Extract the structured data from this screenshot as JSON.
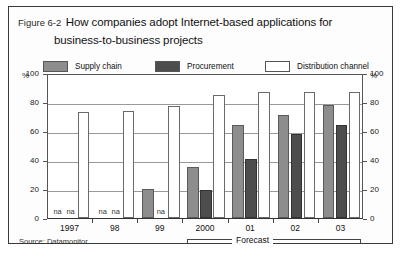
{
  "figure": {
    "label": "Figure 6-2",
    "title_line1": "How companies adopt Internet-based applications for",
    "title_line2": "business-to-business projects",
    "source": "Source: Datamonitor",
    "forecast_label": "Forecast",
    "na_text": "na",
    "percent_symbol": "%"
  },
  "legend": [
    {
      "name": "Supply chain",
      "color": "#8d8d8d"
    },
    {
      "name": "Procurement",
      "color": "#4d4d4d"
    },
    {
      "name": "Distribution channel",
      "color": "#ffffff"
    }
  ],
  "chart_data": {
    "type": "bar",
    "title": "How companies adopt Internet-based applications for business-to-business projects",
    "xlabel": "",
    "ylabel": "%",
    "ylim": [
      0,
      100
    ],
    "yticks": [
      0,
      20,
      40,
      60,
      80,
      100
    ],
    "grid": true,
    "legend_position": "top",
    "categories": [
      "1997",
      "98",
      "99",
      "2000",
      "01",
      "02",
      "03"
    ],
    "series": [
      {
        "name": "Supply chain",
        "color": "#8d8d8d",
        "values": [
          null,
          null,
          20,
          35,
          64,
          71,
          78
        ]
      },
      {
        "name": "Procurement",
        "color": "#4d4d4d",
        "values": [
          null,
          null,
          null,
          19,
          41,
          58,
          64
        ]
      },
      {
        "name": "Distribution channel",
        "color": "#ffffff",
        "values": [
          73,
          74,
          77,
          85,
          87,
          87,
          87
        ]
      }
    ],
    "annotations": [
      {
        "text": "Forecast",
        "spans": [
          "2000",
          "03"
        ]
      },
      {
        "text": "na",
        "category": "1997",
        "series": "Supply chain"
      },
      {
        "text": "na",
        "category": "98",
        "series": "Supply chain"
      },
      {
        "text": "na",
        "category": "99",
        "series": "Procurement"
      }
    ],
    "source": "Source: Datamonitor"
  }
}
